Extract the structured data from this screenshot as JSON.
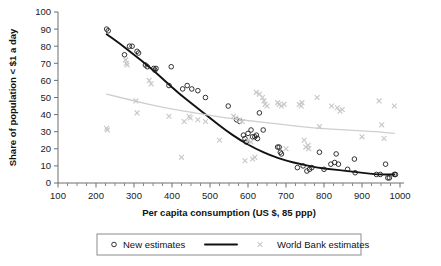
{
  "chart_data": {
    "type": "scatter",
    "title": "",
    "xlabel": "Per capita consumption (US $, 85 ppp)",
    "ylabel": "Share of population < $1 a day",
    "xlim": [
      100,
      1000
    ],
    "ylim": [
      0,
      100
    ],
    "x_ticks": [
      100,
      200,
      300,
      400,
      500,
      600,
      700,
      800,
      900,
      1000
    ],
    "y_ticks": [
      0,
      10,
      20,
      30,
      40,
      50,
      60,
      70,
      80,
      90,
      100
    ],
    "x_minor_step": 25,
    "grid": false,
    "legend_position": "bottom",
    "legend": [
      {
        "label": "New estimates",
        "marker": "open-circle",
        "color": "#1d1d1d"
      },
      {
        "label": "",
        "marker": "line",
        "color": "#111111"
      },
      {
        "label": "World Bank estimates",
        "marker": "cross",
        "color": "#c8c8c8"
      }
    ],
    "series": [
      {
        "name": "New estimates",
        "marker": "open-circle",
        "color": "#1d1d1d",
        "points": [
          [
            228,
            90
          ],
          [
            232,
            89
          ],
          [
            275,
            75
          ],
          [
            288,
            80
          ],
          [
            295,
            80
          ],
          [
            308,
            77
          ],
          [
            312,
            76
          ],
          [
            330,
            69
          ],
          [
            335,
            68
          ],
          [
            352,
            67
          ],
          [
            355,
            66
          ],
          [
            358,
            67
          ],
          [
            398,
            68
          ],
          [
            392,
            57
          ],
          [
            428,
            55
          ],
          [
            440,
            57
          ],
          [
            452,
            55
          ],
          [
            468,
            54
          ],
          [
            488,
            50
          ],
          [
            548,
            45
          ],
          [
            570,
            37
          ],
          [
            578,
            36
          ],
          [
            588,
            28
          ],
          [
            592,
            26
          ],
          [
            595,
            24
          ],
          [
            600,
            29
          ],
          [
            608,
            31
          ],
          [
            612,
            27
          ],
          [
            618,
            27
          ],
          [
            622,
            28
          ],
          [
            625,
            26
          ],
          [
            630,
            41
          ],
          [
            640,
            31
          ],
          [
            678,
            21
          ],
          [
            682,
            21
          ],
          [
            685,
            18
          ],
          [
            688,
            17
          ],
          [
            730,
            9
          ],
          [
            745,
            10
          ],
          [
            755,
            7
          ],
          [
            762,
            8
          ],
          [
            768,
            9
          ],
          [
            788,
            18
          ],
          [
            800,
            8
          ],
          [
            818,
            11
          ],
          [
            828,
            12
          ],
          [
            832,
            17
          ],
          [
            838,
            11
          ],
          [
            862,
            8
          ],
          [
            880,
            14
          ],
          [
            882,
            6
          ],
          [
            938,
            5
          ],
          [
            948,
            5
          ],
          [
            962,
            11
          ],
          [
            968,
            3
          ],
          [
            972,
            3
          ],
          [
            985,
            5
          ],
          [
            988,
            5
          ]
        ]
      },
      {
        "name": "World Bank estimates",
        "marker": "cross",
        "color": "#c8c8c8",
        "points": [
          [
            228,
            32
          ],
          [
            230,
            31
          ],
          [
            278,
            72
          ],
          [
            280,
            70
          ],
          [
            282,
            69
          ],
          [
            305,
            48
          ],
          [
            308,
            41
          ],
          [
            340,
            60
          ],
          [
            345,
            58
          ],
          [
            392,
            39
          ],
          [
            425,
            15
          ],
          [
            432,
            36
          ],
          [
            445,
            39
          ],
          [
            448,
            38
          ],
          [
            468,
            37
          ],
          [
            488,
            36
          ],
          [
            525,
            25
          ],
          [
            562,
            39
          ],
          [
            568,
            38
          ],
          [
            578,
            37
          ],
          [
            585,
            36
          ],
          [
            592,
            13
          ],
          [
            600,
            25
          ],
          [
            608,
            24
          ],
          [
            612,
            14
          ],
          [
            618,
            15
          ],
          [
            622,
            53
          ],
          [
            630,
            52
          ],
          [
            638,
            50
          ],
          [
            642,
            48
          ],
          [
            645,
            46
          ],
          [
            650,
            45
          ],
          [
            678,
            47
          ],
          [
            682,
            46
          ],
          [
            688,
            45
          ],
          [
            695,
            46
          ],
          [
            700,
            20
          ],
          [
            735,
            46
          ],
          [
            740,
            45
          ],
          [
            742,
            47
          ],
          [
            748,
            25
          ],
          [
            752,
            21
          ],
          [
            758,
            22
          ],
          [
            760,
            20
          ],
          [
            782,
            50
          ],
          [
            788,
            33
          ],
          [
            820,
            45
          ],
          [
            835,
            44
          ],
          [
            842,
            42
          ],
          [
            848,
            43
          ],
          [
            900,
            27
          ],
          [
            945,
            48
          ],
          [
            952,
            34
          ],
          [
            958,
            26
          ],
          [
            985,
            45
          ]
        ]
      }
    ],
    "trendlines": [
      {
        "name": "New estimates fit",
        "color": "#111111",
        "points": [
          [
            228,
            87
          ],
          [
            260,
            82
          ],
          [
            300,
            75
          ],
          [
            340,
            68
          ],
          [
            380,
            60
          ],
          [
            420,
            52
          ],
          [
            460,
            45
          ],
          [
            500,
            38
          ],
          [
            540,
            31
          ],
          [
            580,
            25
          ],
          [
            620,
            20
          ],
          [
            660,
            16
          ],
          [
            700,
            13
          ],
          [
            740,
            11
          ],
          [
            780,
            9
          ],
          [
            820,
            8
          ],
          [
            860,
            7
          ],
          [
            900,
            6
          ],
          [
            940,
            5
          ],
          [
            985,
            5
          ]
        ]
      },
      {
        "name": "World Bank estimates fit",
        "color": "#cfcfcf",
        "points": [
          [
            228,
            52
          ],
          [
            300,
            48
          ],
          [
            380,
            44
          ],
          [
            460,
            41
          ],
          [
            540,
            38
          ],
          [
            620,
            36
          ],
          [
            700,
            34
          ],
          [
            780,
            32
          ],
          [
            860,
            31
          ],
          [
            940,
            30
          ],
          [
            985,
            29
          ]
        ]
      }
    ]
  }
}
